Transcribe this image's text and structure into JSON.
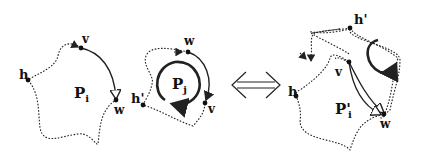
{
  "figure": {
    "left_panel": {
      "polygon_label": "P",
      "polygon_subscript": "i",
      "vertices": {
        "h": "h",
        "v": "v",
        "w": "w"
      }
    },
    "middle_panel": {
      "polygon_label": "P",
      "polygon_subscript": "j",
      "vertices": {
        "h_prime": "h'",
        "v": "v",
        "w": "w"
      }
    },
    "equivalence_symbol": "⟺",
    "right_panel": {
      "polygon_label": "P'",
      "polygon_subscript": "i",
      "vertices": {
        "h": "h",
        "h_prime": "h'",
        "v": "v",
        "w": "w"
      }
    }
  }
}
